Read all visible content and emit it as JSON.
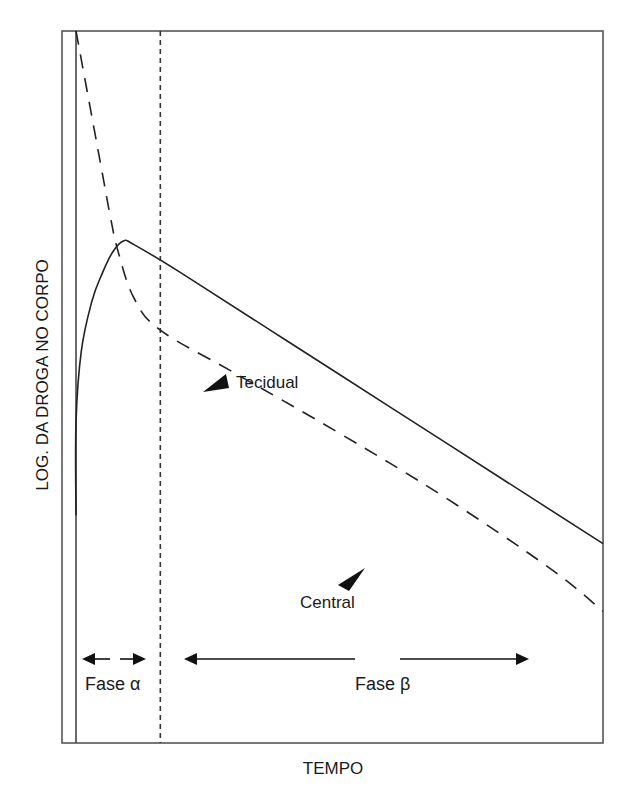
{
  "chart_data": {
    "type": "line",
    "title": "",
    "xlabel": "TEMPO",
    "ylabel": "LOG. DA DROGA NO CORPO",
    "x_scale": "linear (arbitrary units)",
    "y_scale": "log (arbitrary units)",
    "xlim": [
      0,
      100
    ],
    "ylim": [
      0,
      100
    ],
    "grid": false,
    "legend": "none (inline annotations)",
    "series": [
      {
        "name": "Tecidual",
        "style": "solid",
        "points": [
          [
            0,
            32
          ],
          [
            0,
            45
          ],
          [
            1,
            55
          ],
          [
            3,
            62
          ],
          [
            5,
            66
          ],
          [
            7,
            69
          ],
          [
            9,
            70.5
          ],
          [
            11,
            70
          ],
          [
            20,
            66
          ],
          [
            40,
            56.5
          ],
          [
            60,
            47
          ],
          [
            80,
            37.5
          ],
          [
            100,
            28
          ]
        ]
      },
      {
        "name": "Central",
        "style": "dashed",
        "points": [
          [
            0,
            100
          ],
          [
            3,
            88
          ],
          [
            5,
            80
          ],
          [
            6.5,
            74
          ],
          [
            8,
            69
          ],
          [
            11,
            62.5
          ],
          [
            16,
            58
          ],
          [
            30,
            52
          ],
          [
            50,
            43.5
          ],
          [
            70,
            34.5
          ],
          [
            90,
            24.5
          ],
          [
            100,
            18.5
          ]
        ]
      }
    ],
    "reference_lines": [
      {
        "type": "vertical",
        "style": "dotted",
        "x": 16,
        "meaning": "fim da fase alfa"
      }
    ],
    "annotations": [
      {
        "text": "Tecidual",
        "target_series": "Tecidual",
        "pointer": "arrowhead"
      },
      {
        "text": "Central",
        "target_series": "Central",
        "pointer": "arrowhead"
      },
      {
        "text": "Fase α",
        "type": "double-arrow range",
        "x_range": [
          0,
          16
        ]
      },
      {
        "text": "Fase β",
        "type": "double-arrow range",
        "x_range": [
          20,
          88
        ]
      }
    ]
  },
  "labels": {
    "ylabel": "LOG. DA DROGA NO CORPO",
    "xlabel": "TEMPO",
    "tecidual": "Tecidual",
    "central": "Central",
    "fase_alpha": "Fase α",
    "fase_beta": "Fase β"
  }
}
